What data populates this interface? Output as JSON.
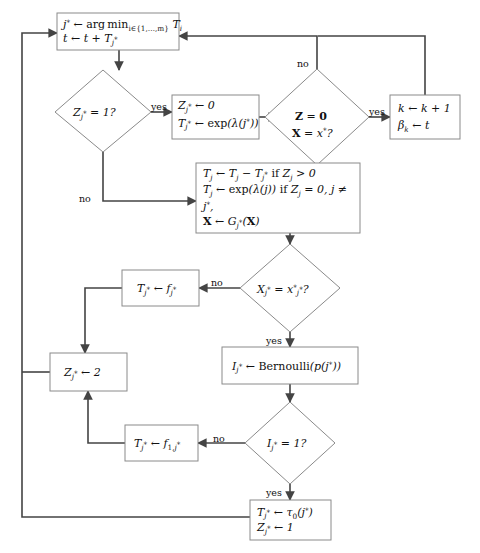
{
  "diagram": {
    "type": "flowchart",
    "canvas": {
      "width": 480,
      "height": 553
    },
    "colors": {
      "background": "#ffffff",
      "node_stroke": "#8a8a8a",
      "edge_stroke": "#444444",
      "text": "#111111"
    }
  },
  "nodes": [
    {
      "id": "init",
      "shape": "rect",
      "lines": [
        "j* ← arg min_{i∈{1,…,m}} T_i",
        "t ← t + T_{j*}"
      ]
    },
    {
      "id": "zj-eq-1",
      "shape": "diamond",
      "lines": [
        "Z_{j*} = 1?"
      ]
    },
    {
      "id": "reset-zj",
      "shape": "rect",
      "lines": [
        "Z_{j*} ← 0",
        "T_{j*} ← exp(λ(j*))"
      ]
    },
    {
      "id": "z-zero-x-eq",
      "shape": "diamond",
      "lines": [
        "Z = 0",
        "X = x*?"
      ]
    },
    {
      "id": "increment-k",
      "shape": "rect",
      "lines": [
        "k ← k + 1",
        "β_k ← t"
      ]
    },
    {
      "id": "update-t-x",
      "shape": "rect",
      "lines": [
        "T_j ← T_j − T_{j*} if Z_j > 0",
        "T_j ← exp(λ(j)) if Z_j = 0, j ≠",
        "j*,",
        "X ← G_{j*}(X)"
      ]
    },
    {
      "id": "xj-eq-xstar",
      "shape": "diamond",
      "lines": [
        "X_{j*} = x*_{j*}?"
      ]
    },
    {
      "id": "set-tj-fj",
      "shape": "rect",
      "lines": [
        "T_{j*} ← f_{j*}"
      ]
    },
    {
      "id": "set-zj-2",
      "shape": "rect",
      "lines": [
        "Z_{j*} ← 2"
      ]
    },
    {
      "id": "bernoulli",
      "shape": "rect",
      "lines": [
        "I_{j*} ← Bernoulli(p(j*))"
      ]
    },
    {
      "id": "ij-eq-1",
      "shape": "diamond",
      "lines": [
        "I_{j*} = 1?"
      ]
    },
    {
      "id": "set-tj-f1j",
      "shape": "rect",
      "lines": [
        "T_{j*} ← f_{1,j*}"
      ]
    },
    {
      "id": "set-tau0",
      "shape": "rect",
      "lines": [
        "T_{j*} ← τ₀(j*)",
        "Z_{j*} ← 1"
      ]
    }
  ],
  "edge_labels": {
    "zj_yes": "yes",
    "zj_no": "no",
    "zxstar_no": "no",
    "zxstar_yes": "yes",
    "xj_no": "no",
    "xj_yes": "yes",
    "ij_no": "no",
    "ij_yes": "yes"
  }
}
